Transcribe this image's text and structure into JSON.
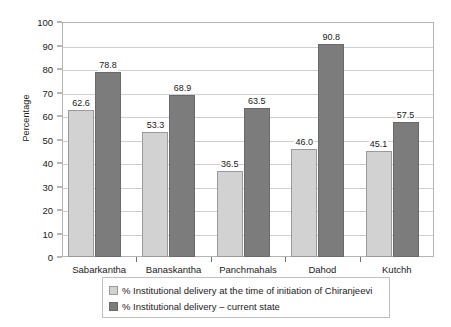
{
  "chart_data": {
    "type": "bar",
    "title": "",
    "xlabel": "",
    "ylabel": "Percentage",
    "ylim": [
      0,
      100
    ],
    "ytick_step": 10,
    "yticks": [
      0,
      10,
      20,
      30,
      40,
      50,
      60,
      70,
      80,
      90,
      100
    ],
    "grid": true,
    "legend_position": "bottom",
    "categories": [
      "Sabarkantha",
      "Banaskantha",
      "Panchmahals",
      "Dahod",
      "Kutchh"
    ],
    "series": [
      {
        "name": "% Institutional delivery at the time of initiation of Chiranjeevi",
        "color": "#d2d2d2",
        "values": [
          62.6,
          53.3,
          36.5,
          46.0,
          45.1
        ],
        "labels": [
          "62.6",
          "53.3",
          "36.5",
          "46.0",
          "45.1"
        ]
      },
      {
        "name": "% Institutional delivery – current state",
        "color": "#7c7c7c",
        "values": [
          78.8,
          68.9,
          63.5,
          90.8,
          57.5
        ],
        "labels": [
          "78.8",
          "68.9",
          "63.5",
          "90.8",
          "57.5"
        ]
      }
    ]
  },
  "axis": {
    "y_title": "Percentage",
    "y_tick_labels": [
      "0",
      "10",
      "20",
      "30",
      "40",
      "50",
      "60",
      "70",
      "80",
      "90",
      "100"
    ],
    "x_tick_labels": [
      "Sabarkantha",
      "Banaskantha",
      "Panchmahals",
      "Dahod",
      "Kutchh"
    ]
  },
  "legend": {
    "items": [
      {
        "label": "% Institutional delivery at the time of initiation of Chiranjeevi",
        "swatch": "series-a"
      },
      {
        "label": "% Institutional delivery – current state",
        "swatch": "series-b"
      }
    ]
  },
  "colors": {
    "series_a": "#d2d2d2",
    "series_b": "#7c7c7c",
    "gridline": "#cfcfcf",
    "frame": "#b4b4b4",
    "text": "#1a1a1a"
  }
}
